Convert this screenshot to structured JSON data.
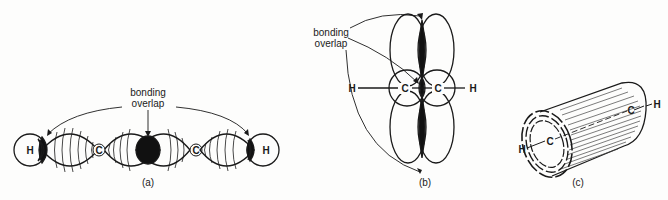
{
  "figure": {
    "panels": [
      {
        "id": "a",
        "caption": "(a)",
        "annotation": {
          "line1": "bonding",
          "line2": "overlap"
        },
        "atoms": [
          "H",
          "C",
          "C",
          "H"
        ],
        "description": "Sigma bonds: H–C and C–C orbital overlaps along the bond axis"
      },
      {
        "id": "b",
        "caption": "(b)",
        "annotation": {
          "line1": "bonding",
          "line2": "overlap"
        },
        "atoms": [
          "H",
          "C",
          "C",
          "H"
        ],
        "description": "Pi bonds: side-by-side overlap of p orbitals above and below the axis"
      },
      {
        "id": "c",
        "caption": "(c)",
        "atoms": [
          "H",
          "C",
          "C",
          "H"
        ],
        "description": "Cylindrical electron cloud around the H–C≡C–H axis"
      }
    ],
    "colors": {
      "ink": "#1a1a1a",
      "paper": "#fdfdfc",
      "hatch": "#555555"
    }
  }
}
